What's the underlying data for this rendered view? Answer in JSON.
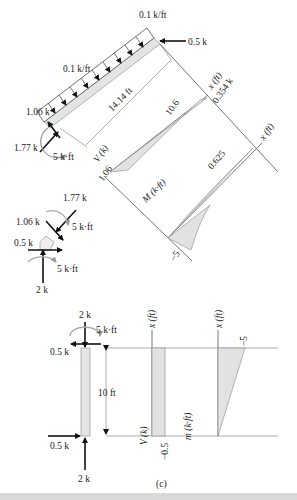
{
  "figure": {
    "caption": "(c)",
    "inclined_member": {
      "load_top": "0.1 k/ft",
      "load_mid": "0.1 k/ft",
      "right_force": "0.5 k",
      "left_force_up": "1.06 k",
      "left_force_axial": "1.77 k",
      "left_moment": "5 k·ft",
      "length": "14.14 ft"
    },
    "inclined_shear_diagram": {
      "axis_label": "V (k)",
      "x_label": "x (ft)",
      "value_start": "1.06",
      "value_zero_at": "10.6",
      "value_end": "0.354 k"
    },
    "inclined_moment_diagram": {
      "axis_label": "M (k·ft)",
      "x_label": "x (ft)",
      "value_start": "−5",
      "value_zero_at": "0.625"
    },
    "joint": {
      "force_axial": "1.77 k",
      "force_shear": "1.06 k",
      "moment_top": "5 k·ft",
      "force_horizontal": "0.5 k",
      "moment_bottom": "5 k·ft",
      "force_vertical": "2 k"
    },
    "vertical_member": {
      "top_force": "2 k",
      "top_moment": "5 k·ft",
      "top_horizontal": "0.5 k",
      "length": "10 ft",
      "bottom_horizontal": "0.5 k",
      "bottom_force": "2 k"
    },
    "vertical_shear_diagram": {
      "axis_label": "V (k)",
      "x_label": "x (ft)",
      "value": "−0.5"
    },
    "vertical_moment_diagram": {
      "axis_label": "m (k·ft)",
      "x_label": "x (ft)",
      "value": "−5"
    }
  }
}
